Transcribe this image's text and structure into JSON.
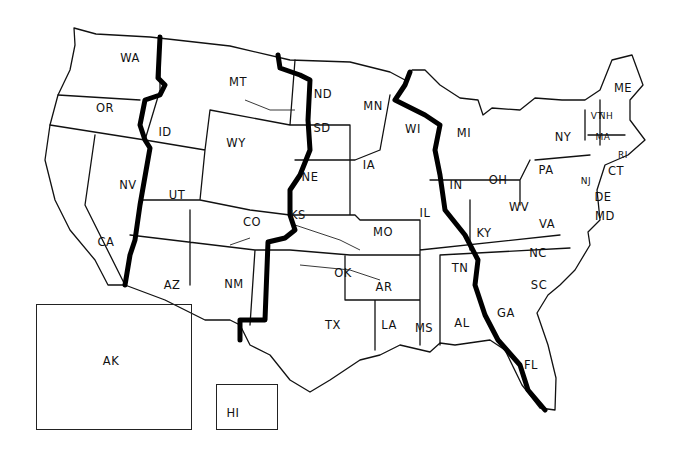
{
  "map": {
    "title": "United States Time Zones",
    "states": [
      {
        "abbr": "WA",
        "x": 130,
        "y": 58
      },
      {
        "abbr": "OR",
        "x": 105,
        "y": 108
      },
      {
        "abbr": "CA",
        "x": 106,
        "y": 242
      },
      {
        "abbr": "NV",
        "x": 128,
        "y": 185
      },
      {
        "abbr": "ID",
        "x": 165,
        "y": 132
      },
      {
        "abbr": "MT",
        "x": 238,
        "y": 82
      },
      {
        "abbr": "WY",
        "x": 236,
        "y": 143
      },
      {
        "abbr": "UT",
        "x": 177,
        "y": 195
      },
      {
        "abbr": "CO",
        "x": 252,
        "y": 222
      },
      {
        "abbr": "AZ",
        "x": 172,
        "y": 285
      },
      {
        "abbr": "NM",
        "x": 234,
        "y": 284
      },
      {
        "abbr": "ND",
        "x": 323,
        "y": 94
      },
      {
        "abbr": "SD",
        "x": 322,
        "y": 128
      },
      {
        "abbr": "NE",
        "x": 310,
        "y": 177
      },
      {
        "abbr": "KS",
        "x": 298,
        "y": 215
      },
      {
        "abbr": "OK",
        "x": 343,
        "y": 273
      },
      {
        "abbr": "TX",
        "x": 333,
        "y": 325
      },
      {
        "abbr": "MN",
        "x": 373,
        "y": 106
      },
      {
        "abbr": "IA",
        "x": 369,
        "y": 165
      },
      {
        "abbr": "MO",
        "x": 383,
        "y": 232
      },
      {
        "abbr": "AR",
        "x": 384,
        "y": 287
      },
      {
        "abbr": "LA",
        "x": 389,
        "y": 325
      },
      {
        "abbr": "MS",
        "x": 424,
        "y": 328
      },
      {
        "abbr": "AL",
        "x": 462,
        "y": 323
      },
      {
        "abbr": "WI",
        "x": 413,
        "y": 129
      },
      {
        "abbr": "IL",
        "x": 425,
        "y": 213
      },
      {
        "abbr": "MI",
        "x": 464,
        "y": 133
      },
      {
        "abbr": "IN",
        "x": 456,
        "y": 185
      },
      {
        "abbr": "OH",
        "x": 498,
        "y": 180
      },
      {
        "abbr": "KY",
        "x": 484,
        "y": 233
      },
      {
        "abbr": "TN",
        "x": 460,
        "y": 268
      },
      {
        "abbr": "GA",
        "x": 506,
        "y": 313
      },
      {
        "abbr": "FL",
        "x": 531,
        "y": 365
      },
      {
        "abbr": "SC",
        "x": 539,
        "y": 285
      },
      {
        "abbr": "NC",
        "x": 538,
        "y": 253
      },
      {
        "abbr": "VA",
        "x": 547,
        "y": 224
      },
      {
        "abbr": "WV",
        "x": 519,
        "y": 207
      },
      {
        "abbr": "PA",
        "x": 546,
        "y": 170
      },
      {
        "abbr": "NY",
        "x": 563,
        "y": 137
      },
      {
        "abbr": "ME",
        "x": 623,
        "y": 88
      },
      {
        "abbr": "VT",
        "x": 597,
        "y": 116
      },
      {
        "abbr": "NH",
        "x": 606,
        "y": 116
      },
      {
        "abbr": "MA",
        "x": 603,
        "y": 137
      },
      {
        "abbr": "RI",
        "x": 623,
        "y": 155
      },
      {
        "abbr": "CT",
        "x": 616,
        "y": 171
      },
      {
        "abbr": "NJ",
        "x": 586,
        "y": 181
      },
      {
        "abbr": "DE",
        "x": 603,
        "y": 197
      },
      {
        "abbr": "MD",
        "x": 605,
        "y": 216
      },
      {
        "abbr": "AK",
        "x": 111,
        "y": 361
      },
      {
        "abbr": "HI",
        "x": 233,
        "y": 413
      }
    ]
  }
}
